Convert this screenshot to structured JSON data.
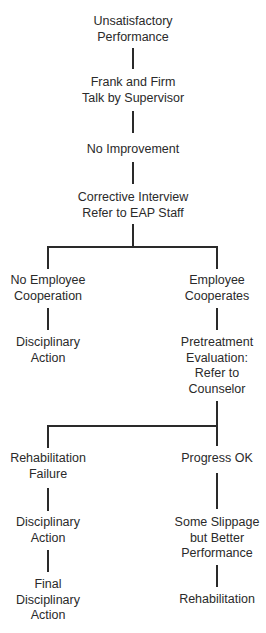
{
  "diagram": {
    "type": "flowchart",
    "nodes": {
      "n1": [
        "Unsatisfactory",
        "Performance"
      ],
      "n2": [
        "Frank and Firm",
        "Talk by Supervisor"
      ],
      "n3": [
        "No Improvement"
      ],
      "n4": [
        "Corrective Interview",
        "Refer to EAP Staff"
      ],
      "n5": [
        "No Employee",
        "Cooperation"
      ],
      "n6": [
        "Employee",
        "Cooperates"
      ],
      "n7": [
        "Disciplinary",
        "Action"
      ],
      "n8": [
        "Pretreatment",
        "Evaluation:",
        "Refer to",
        "Counselor"
      ],
      "n9": [
        "Rehabilitation",
        "Failure"
      ],
      "n10": [
        "Progress OK"
      ],
      "n11": [
        "Disciplinary",
        "Action"
      ],
      "n12": [
        "Some Slippage",
        "but Better",
        "Performance"
      ],
      "n13": [
        "Final",
        "Disciplinary",
        "Action"
      ],
      "n14": [
        "Rehabilitation"
      ]
    },
    "edges": [
      [
        "n1",
        "n2"
      ],
      [
        "n2",
        "n3"
      ],
      [
        "n3",
        "n4"
      ],
      [
        "n4",
        "n5"
      ],
      [
        "n4",
        "n6"
      ],
      [
        "n5",
        "n7"
      ],
      [
        "n6",
        "n8"
      ],
      [
        "n8",
        "n9"
      ],
      [
        "n8",
        "n10"
      ],
      [
        "n9",
        "n11"
      ],
      [
        "n11",
        "n13"
      ],
      [
        "n10",
        "n12"
      ],
      [
        "n12",
        "n14"
      ]
    ],
    "line_color": "#2a2a2a"
  }
}
